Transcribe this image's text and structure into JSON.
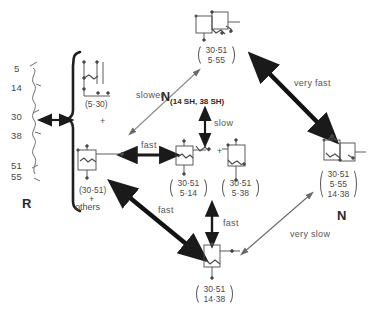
{
  "figure": {
    "type": "diagram",
    "residues": {
      "label": "R",
      "numbers": [
        "5",
        "14",
        "30",
        "38",
        "51",
        "55"
      ]
    },
    "nodes": {
      "reduced_bracket": {
        "upper_species": "(5·30)",
        "plus": "+",
        "lower_species": "(30·51)",
        "plus2": "+",
        "others": "others"
      },
      "top": {
        "lines": [
          "30·51",
          "5·55"
        ]
      },
      "center_left": {
        "lines": [
          "30·51",
          "5·14"
        ]
      },
      "center_right": {
        "lines": [
          "30·51",
          "5·38"
        ]
      },
      "center_plus": "+",
      "bottom": {
        "lines": [
          "30·51",
          "14·38"
        ]
      },
      "right": {
        "lines": [
          "30·51",
          "5·55",
          "14·38"
        ],
        "label": "N"
      }
    },
    "intermediate_label": {
      "main": "N",
      "sub": "(14 SH, 38 SH)"
    },
    "rates": {
      "slower": "slower",
      "fast_horizontal": "fast",
      "very_fast": "very fast",
      "slow_vertical": "slow",
      "fast_diagonal": "fast",
      "fast_vertical": "fast",
      "very_slow": "very slow"
    },
    "colors": {
      "ink": "#3a3a3a",
      "thick_arrow": "#1a1a1a",
      "thin_arrow": "#6a6a6a",
      "background": "#ffffff"
    }
  }
}
